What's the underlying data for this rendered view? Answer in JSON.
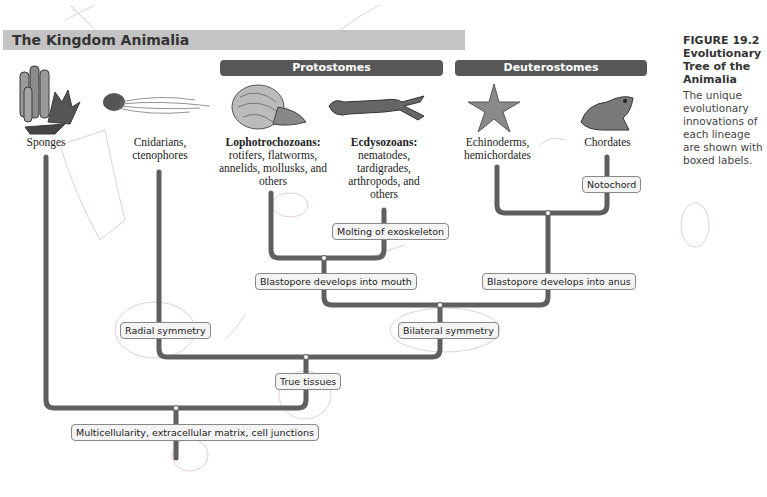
{
  "header": {
    "title": "The Kingdom Animalia"
  },
  "groups": [
    {
      "label": "Protostomes"
    },
    {
      "label": "Deuterostomes"
    }
  ],
  "caption": {
    "figure": "FIGURE 19.2",
    "title": "Evolutionary Tree of the Animalia",
    "body": "The unique evolutionary innovations of each lineage are shown with boxed labels."
  },
  "lineages": [
    {
      "name": "Sponges",
      "organism_icon": "sponge-icon"
    },
    {
      "name": "Cnidarians, ctenophores",
      "organism_icon": "jellyfish-icon"
    },
    {
      "name": "Lophotrochozoans:",
      "members": "rotifers, flatworms, annelids, mollusks, and others",
      "organism_icon": "nautilus-icon"
    },
    {
      "name": "Ecdysozoans:",
      "members": "nematodes, tardigrades, arthropods, and others",
      "organism_icon": "crayfish-icon"
    },
    {
      "name": "Echinoderms, hemichordates",
      "organism_icon": "starfish-icon"
    },
    {
      "name": "Chordates",
      "organism_icon": "frog-icon"
    }
  ],
  "innovations": {
    "notochord": "Notochord",
    "molting": "Molting of exoskeleton",
    "mouth": "Blastopore develops into mouth",
    "anus": "Blastopore develops into anus",
    "radial": "Radial symmetry",
    "bilateral": "Bilateral symmetry",
    "tissues": "True tissues",
    "multicellularity": "Multicellularity, extracellular matrix, cell junctions"
  },
  "colors": {
    "branch": "#5f5f5f",
    "header_bar": "#c4c4c4",
    "group_pill": "#575757",
    "annotation_ink": "#c9a8c4"
  },
  "handwritten_annotations": [
    "mouth",
    "Element excluded (?)",
    "5th",
    "6th",
    "4th",
    "3rd",
    "1st",
    "2nd",
    "X"
  ]
}
